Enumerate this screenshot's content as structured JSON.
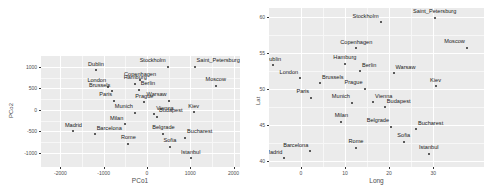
{
  "figure": {
    "background": "#ffffff",
    "panel_background": "#ebebeb",
    "gridline_color": "#ffffff",
    "point_color": "#2b2b2b",
    "text_color": "#4d4d4d"
  },
  "chart_data": [
    {
      "type": "scatter",
      "title": "",
      "xlabel": "PCo1",
      "ylabel": "PCo2",
      "xlim": [
        -2450,
        2150
      ],
      "ylim": [
        -1330,
        1250
      ],
      "xticks": [
        "-2000",
        "-1000",
        "0",
        "1000",
        "2000"
      ],
      "xtick_values": [
        -2000,
        -1000,
        0,
        1000,
        2000
      ],
      "yticks": [
        "1000",
        "500",
        "0",
        "-500",
        "-1000"
      ],
      "ytick_values": [
        1000,
        500,
        0,
        -500,
        -1000
      ],
      "grid": true,
      "legend": "none",
      "labels": [
        "Dublin",
        "London",
        "Brussels",
        "Paris",
        "Madrid",
        "Barcelona",
        "Milan",
        "Rome",
        "Munich",
        "Hamburg",
        "Berlin",
        "Copenhagen",
        "Stockholm",
        "Saint_Petersburg",
        "Moscow",
        "Warsaw",
        "Prague",
        "Vienna",
        "Budapest",
        "Belgrade",
        "Bucharest",
        "Sofia",
        "Istanbul",
        "Kiev"
      ],
      "x": [
        -1180,
        -900,
        -800,
        -760,
        -1700,
        -1210,
        -500,
        -430,
        -280,
        -270,
        -190,
        -160,
        480,
        1100,
        1590,
        500,
        -60,
        170,
        230,
        380,
        880,
        530,
        1010,
        1080
      ],
      "y": [
        920,
        530,
        430,
        215,
        -495,
        -570,
        -340,
        -790,
        -65,
        600,
        460,
        690,
        1000,
        1000,
        560,
        210,
        175,
        -105,
        -160,
        -555,
        -655,
        -855,
        -1130,
        -55
      ],
      "label_positions": [
        "above",
        "above-left",
        "above-left",
        "above-left",
        "above",
        "above-right",
        "above-left",
        "above",
        "above-left",
        "above",
        "above-right",
        "above",
        "above-left",
        "above-right",
        "above",
        "above-left",
        "above",
        "above-right",
        "above-right",
        "above",
        "above-right",
        "above",
        "above"
      ]
    },
    {
      "type": "scatter",
      "title": "",
      "xlabel": "Long",
      "ylabel": "Lat",
      "xlim": [
        -7.2,
        41.5
      ],
      "ylim": [
        39.2,
        61.3
      ],
      "xticks": [
        "0",
        "10",
        "20",
        "30"
      ],
      "xtick_values": [
        0,
        10,
        20,
        30
      ],
      "yticks": [
        "60",
        "55",
        "50",
        "45",
        "40"
      ],
      "ytick_values": [
        60,
        55,
        50,
        45,
        40
      ],
      "grid": true,
      "legend": "none",
      "labels": [
        "Dublin",
        "London",
        "Brussels",
        "Paris",
        "Madrid",
        "Barcelona",
        "Milan",
        "Rome",
        "Munich",
        "Hamburg",
        "Berlin",
        "Copenhagen",
        "Stockholm",
        "Saint_Petersburg",
        "Moscow",
        "Warsaw",
        "Prague",
        "Vienna",
        "Budapest",
        "Belgrade",
        "Bucharest",
        "Sofia",
        "Istanbul",
        "Kiev"
      ],
      "x": [
        -6.26,
        -0.13,
        4.35,
        2.35,
        -3.7,
        2.17,
        9.19,
        12.5,
        11.58,
        9.99,
        13.4,
        12.57,
        18.07,
        30.34,
        37.62,
        21.01,
        14.44,
        16.37,
        19.04,
        20.46,
        26.1,
        23.32,
        28.98,
        30.52
      ],
      "y": [
        53.35,
        51.51,
        50.85,
        48.86,
        40.42,
        41.39,
        45.46,
        41.9,
        48.14,
        53.55,
        52.52,
        55.68,
        59.33,
        59.93,
        55.76,
        52.23,
        50.08,
        48.21,
        47.5,
        44.79,
        44.43,
        42.7,
        41.01,
        50.45
      ],
      "label_positions": [
        "above",
        "above-left",
        "above-right",
        "above-left",
        "above-left",
        "above-left",
        "above",
        "above",
        "above-left",
        "above",
        "above-right",
        "above",
        "above-left",
        "above",
        "above-left",
        "above-right",
        "above-left",
        "above-right",
        "above-right",
        "above-left",
        "above-right",
        "above",
        "above"
      ]
    }
  ]
}
